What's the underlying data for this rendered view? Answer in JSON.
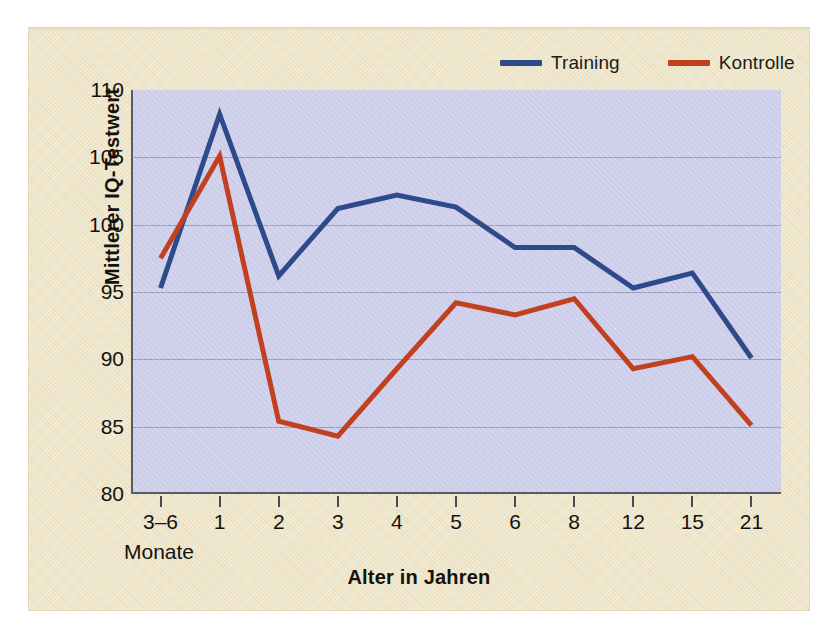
{
  "figure": {
    "page_background": "#f0e7cc",
    "plot_background": "#ccceea"
  },
  "legend": {
    "position": "top-right",
    "items": [
      {
        "label": "Training",
        "color": "#2d4a8a",
        "icon": "line-swatch-icon"
      },
      {
        "label": "Kontrolle",
        "color": "#c1401f",
        "icon": "line-swatch-icon"
      }
    ]
  },
  "axes": {
    "y_title": "Mittlerer IQ-Testwert",
    "x_title": "Alter in Jahren",
    "x_sub_label": "Monate",
    "y_ticks": [
      "80",
      "85",
      "90",
      "95",
      "100",
      "105",
      "110"
    ],
    "x_ticks": [
      "3–6",
      "1",
      "2",
      "3",
      "4",
      "5",
      "6",
      "8",
      "12",
      "15",
      "21"
    ]
  },
  "chart_data": {
    "type": "line",
    "title": "",
    "xlabel": "Alter in Jahren",
    "ylabel": "Mittlerer IQ-Testwert",
    "categories": [
      "3–6",
      "1",
      "2",
      "3",
      "4",
      "5",
      "6",
      "8",
      "12",
      "15",
      "21"
    ],
    "category_note": "Erster Wert in Monaten (3–6 Monate), übrige Werte in Jahren",
    "ylim": [
      80,
      110
    ],
    "ytick_step": 5,
    "grid": true,
    "grid_axis": "y",
    "legend_position": "top-right",
    "series": [
      {
        "name": "Training",
        "color": "#2d4a8a",
        "values": [
          95.3,
          108.2,
          96.2,
          101.2,
          102.2,
          101.3,
          98.3,
          98.3,
          95.3,
          96.4,
          90.1
        ]
      },
      {
        "name": "Kontrolle",
        "color": "#c1401f",
        "values": [
          97.5,
          105.1,
          85.4,
          84.3,
          89.3,
          94.2,
          93.3,
          94.5,
          89.3,
          90.2,
          85.1
        ]
      }
    ]
  }
}
